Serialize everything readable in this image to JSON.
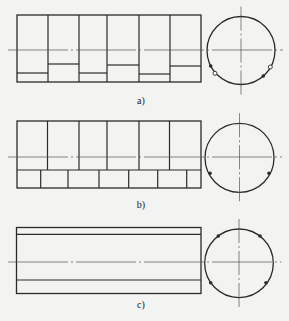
{
  "figure": {
    "colors": {
      "background": "#f3f3f1",
      "stroke": "#2a2a2a",
      "centerline": "#555555"
    },
    "panels": [
      {
        "id": "a",
        "label": "a)",
        "label_pos": [
          141,
          100
        ],
        "rect": {
          "x": 17,
          "y": 15,
          "w": 184,
          "h": 67
        },
        "centerline_y": 50,
        "dividers_x": [
          48,
          79,
          107,
          139,
          170
        ],
        "cell_inner_lines_y": [
          73,
          64,
          73,
          65,
          74,
          66
        ],
        "circle": {
          "cx": 241,
          "cy": 50.5,
          "r": 34
        },
        "markers": [
          {
            "x": 210.7,
            "y": 66,
            "type": "filled"
          },
          {
            "x": 215,
            "y": 73.3,
            "type": "open"
          },
          {
            "x": 270.3,
            "y": 67,
            "type": "open"
          },
          {
            "x": 263.3,
            "y": 76,
            "type": "filled"
          }
        ]
      },
      {
        "id": "b",
        "label": "b)",
        "label_pos": [
          141,
          204
        ],
        "rect": {
          "x": 17,
          "y": 121,
          "w": 184,
          "h": 67
        },
        "upper_bottom_y": 170,
        "centerline_y": 157,
        "upper_dividers_x": [
          47.5,
          79,
          107,
          139,
          169.5
        ],
        "lower_dividers_x": [
          40.7,
          68,
          99,
          128.7,
          157.7,
          186.7
        ],
        "circle": {
          "cx": 239.5,
          "cy": 157.8,
          "r": 34.5
        },
        "markers": [
          {
            "x": 210,
            "y": 173.3,
            "type": "filled"
          },
          {
            "x": 269,
            "y": 173.3,
            "type": "filled"
          }
        ]
      },
      {
        "id": "c",
        "label": "c)",
        "label_pos": [
          141,
          304
        ],
        "rect": {
          "x": 16.5,
          "y": 227.5,
          "w": 184.5,
          "h": 66
        },
        "inner_lines_y": [
          234.3,
          280
        ],
        "centerline_y": 262,
        "circle": {
          "cx": 239,
          "cy": 263.3,
          "r": 34.3
        },
        "markers": [
          {
            "x": 218.3,
            "y": 236,
            "type": "filled"
          },
          {
            "x": 260,
            "y": 236,
            "type": "filled"
          },
          {
            "x": 210.7,
            "y": 282.7,
            "type": "filled"
          },
          {
            "x": 266,
            "y": 282.7,
            "type": "filled"
          }
        ]
      }
    ]
  }
}
